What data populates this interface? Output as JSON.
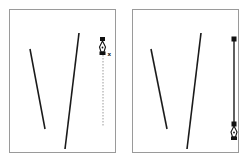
{
  "figure": {
    "colors": {
      "stroke": "#1a1a1a",
      "frame": "#9a9a9a",
      "guide": "#9a9a9a"
    },
    "panels": [
      {
        "id": "step-1",
        "lines": [
          {
            "x1": 20,
            "y1": 39,
            "x2": 35,
            "y2": 119
          },
          {
            "x1": 69,
            "y1": 23,
            "x2": 55,
            "y2": 139
          }
        ],
        "anchor": {
          "x": 93,
          "y": 44
        },
        "guide": {
          "x": 93,
          "y1": 44,
          "y2": 116,
          "style": "dotted"
        },
        "cursor": "pen-tool-x-cursor",
        "cursor_modifier": "x"
      },
      {
        "id": "step-2",
        "lines": [
          {
            "x1": 18,
            "y1": 39,
            "x2": 34,
            "y2": 119
          },
          {
            "x1": 68,
            "y1": 23,
            "x2": 54,
            "y2": 139
          }
        ],
        "segment": {
          "x": 101,
          "y1": 29,
          "y2": 114
        },
        "anchors": [
          {
            "x": 101,
            "y": 29
          },
          {
            "x": 101,
            "y": 114
          }
        ],
        "cursor": "pen-tool-cursor"
      }
    ]
  }
}
